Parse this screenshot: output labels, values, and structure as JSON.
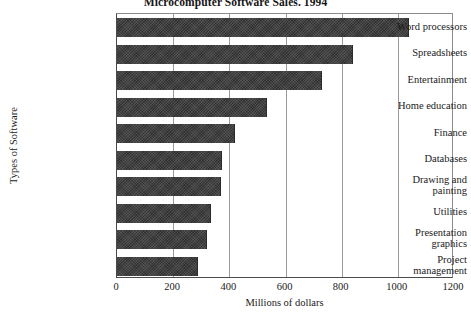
{
  "chart_data": {
    "type": "bar",
    "orientation": "horizontal",
    "title": "Microcomputer Software Sales. 1994",
    "xlabel": "Millions of dollars",
    "ylabel": "Types of Software",
    "xlim": [
      0,
      1200
    ],
    "xticks": [
      "0",
      "200",
      "400",
      "600",
      "800",
      "1000",
      "1200"
    ],
    "xtick_values": [
      0,
      200,
      400,
      600,
      800,
      1000,
      1200
    ],
    "grid": "vertical",
    "legend": "none",
    "bar_color": "#3b3b3b",
    "categories": [
      "Word processors",
      "Spreadsheets",
      "Entertainment",
      "Home education",
      "Finance",
      "Databases",
      "Drawing and painting",
      "Utilities",
      "Presentation graphics",
      "Project management"
    ],
    "category_lines": [
      [
        "Word processors"
      ],
      [
        "Spreadsheets"
      ],
      [
        "Entertainment"
      ],
      [
        "Home education"
      ],
      [
        "Finance"
      ],
      [
        "Databases"
      ],
      [
        "Drawing and",
        "painting"
      ],
      [
        "Utilities"
      ],
      [
        "Presentation",
        "graphics"
      ],
      [
        "Project",
        "management"
      ]
    ],
    "values": [
      1040,
      840,
      730,
      535,
      420,
      375,
      370,
      335,
      320,
      290
    ]
  }
}
